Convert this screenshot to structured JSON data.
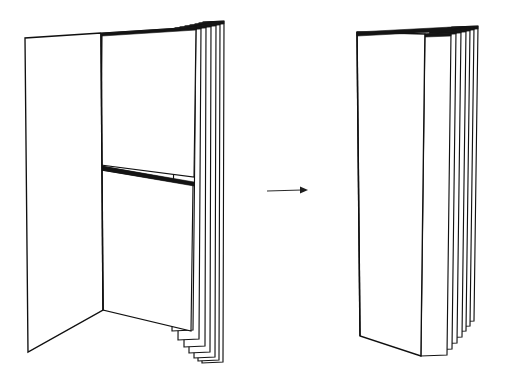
{
  "document": {
    "title": "Folded booklet transformation diagram",
    "background_color": "#ffffff",
    "ink_color": "#121212",
    "width": 513,
    "height": 382
  },
  "figures": {
    "left": {
      "name": "open-booklet-with-cut-page",
      "caption": "",
      "description": "Open booklet seen in perspective, spine vertical at center, left cover swung open toward viewer, right side showing a stack of seven page edges; the frontmost right page is severed by a horizontal cut",
      "spine": {
        "top_x": 101,
        "top_y": 33,
        "bottom_x": 103,
        "bottom_y": 310
      },
      "left_cover": {
        "points": "101,33 25,38 28,352 103,310",
        "corners": [
          [
            101,
            33
          ],
          [
            25,
            38
          ],
          [
            28,
            352
          ],
          [
            103,
            310
          ]
        ]
      },
      "front_right_page_upper": {
        "points": "103,33 196,27 193,176 101,165"
      },
      "front_right_page_lower": {
        "points": "101,169 194,184 191,330 103,310"
      },
      "cut": {
        "from_x": 101,
        "from_y": 166,
        "to_x": 194,
        "to_y": 183
      },
      "page_count": 7,
      "page_edges": [
        {
          "index": 1,
          "top_x": 196,
          "top_y": 27,
          "bottom_x": 193,
          "bottom_y": 330,
          "thickness": 3.0
        },
        {
          "index": 2,
          "top_x": 201,
          "top_y": 26,
          "bottom_x": 199,
          "bottom_y": 339,
          "thickness": 3.0
        },
        {
          "index": 3,
          "top_x": 206,
          "top_y": 25,
          "bottom_x": 205,
          "bottom_y": 346,
          "thickness": 3.0
        },
        {
          "index": 4,
          "top_x": 211,
          "top_y": 24,
          "bottom_x": 210,
          "bottom_y": 352,
          "thickness": 3.0
        },
        {
          "index": 5,
          "top_x": 216,
          "top_y": 23,
          "bottom_x": 215,
          "bottom_y": 357,
          "thickness": 3.0
        },
        {
          "index": 6,
          "top_x": 220,
          "top_y": 22,
          "bottom_x": 219,
          "bottom_y": 360,
          "thickness": 3.0
        },
        {
          "index": 7,
          "top_x": 224,
          "top_y": 21,
          "bottom_x": 223,
          "bottom_y": 362,
          "thickness": 3.0
        }
      ]
    },
    "right": {
      "name": "closed-folded-booklet",
      "caption": "",
      "description": "Booklet after folding: front cover closed flat, seven staggered page edges fanning to the right",
      "spine": {
        "top_x": 357,
        "top_y": 32,
        "bottom_x": 360,
        "bottom_y": 336
      },
      "front_cover": {
        "points": "357,32 476,38 474,353 360,336",
        "corners": [
          [
            357,
            32
          ],
          [
            476,
            38
          ],
          [
            474,
            353
          ],
          [
            360,
            336
          ]
        ]
      },
      "page_count": 7,
      "page_edges": [
        {
          "index": 1,
          "top_x": 451,
          "top_y": 33,
          "bottom_x": 447,
          "bottom_y": 355,
          "thickness": 3.0
        },
        {
          "index": 2,
          "top_x": 456,
          "top_y": 31,
          "bottom_x": 452,
          "bottom_y": 349,
          "thickness": 3.0
        },
        {
          "index": 3,
          "top_x": 461,
          "top_y": 30,
          "bottom_x": 457,
          "bottom_y": 343,
          "thickness": 3.0
        },
        {
          "index": 4,
          "top_x": 466,
          "top_y": 29,
          "bottom_x": 462,
          "bottom_y": 337,
          "thickness": 3.0
        },
        {
          "index": 5,
          "top_x": 470,
          "top_y": 28,
          "bottom_x": 466,
          "bottom_y": 331,
          "thickness": 3.0
        },
        {
          "index": 6,
          "top_x": 474,
          "top_y": 27,
          "bottom_x": 470,
          "bottom_y": 326,
          "thickness": 3.0
        },
        {
          "index": 7,
          "top_x": 478,
          "top_y": 26,
          "bottom_x": 474,
          "bottom_y": 321,
          "thickness": 3.0
        }
      ]
    }
  },
  "arrow": {
    "name": "transformation-arrow",
    "direction": "right",
    "start_x": 267,
    "start_y": 191,
    "end_x": 308,
    "end_y": 190,
    "color": "#2b2b2b",
    "label": ""
  }
}
